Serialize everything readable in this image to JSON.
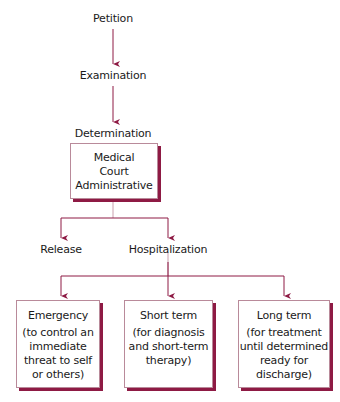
{
  "flow": {
    "petition": "Petition",
    "examination": "Examination",
    "determination": "Determination",
    "determination_box": [
      "Medical",
      "Court",
      "Administrative"
    ],
    "release": "Release",
    "hospitalization": "Hospitalization",
    "types": [
      {
        "title": "Emergency",
        "desc": [
          "(to control an",
          "immediate",
          "threat to self",
          "or others)"
        ]
      },
      {
        "title": "Short term",
        "desc": [
          "(for diagnosis",
          "and short-term",
          "therapy)"
        ]
      },
      {
        "title": "Long term",
        "desc": [
          "(for treatment",
          "until determined",
          "ready for",
          "discharge)"
        ]
      }
    ]
  },
  "colors": {
    "arrow": "#8e1a44",
    "line": "#c9a0ae",
    "shadow": "#8e1a44"
  }
}
